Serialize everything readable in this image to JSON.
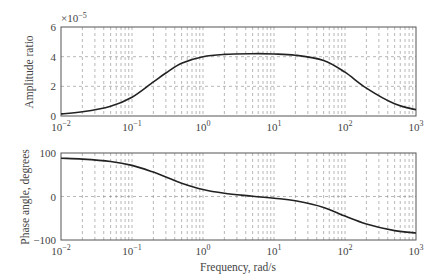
{
  "chart_data": [
    {
      "type": "line",
      "title": "",
      "xlabel": "",
      "ylabel": "Amplitude ratio",
      "xscale": "log",
      "xlim": [
        0.01,
        1000
      ],
      "ylim": [
        0,
        6e-05
      ],
      "y_multiplier_label": "×10",
      "y_multiplier_exp": "−5",
      "yticks": [
        0,
        2,
        4,
        6
      ],
      "ytick_labels": [
        "0",
        "2",
        "4",
        "6"
      ],
      "xticks": [
        0.01,
        0.1,
        1,
        10,
        100,
        1000
      ],
      "xtick_base": "10",
      "xtick_exps": [
        "−2",
        "−1",
        "0",
        "1",
        "2",
        "3"
      ],
      "grid": true,
      "series": [
        {
          "name": "Amplitude ratio",
          "x": [
            0.01,
            0.02,
            0.05,
            0.1,
            0.2,
            0.3,
            0.5,
            1,
            2,
            5,
            10,
            20,
            50,
            100,
            200,
            500,
            1000
          ],
          "values": [
            1.4e-06,
            2.8e-06,
            6.6e-06,
            1.27e-05,
            2.3e-05,
            2.9e-05,
            3.55e-05,
            4e-05,
            4.15e-05,
            4.2e-05,
            4.18e-05,
            4.1e-05,
            3.75e-05,
            2.95e-05,
            1.88e-05,
            8.2e-06,
            4.2e-06
          ]
        }
      ]
    },
    {
      "type": "line",
      "title": "",
      "xlabel": "Frequency, rad/s",
      "ylabel": "Phase angle, degrees",
      "xscale": "log",
      "xlim": [
        0.01,
        1000
      ],
      "ylim": [
        -100,
        100
      ],
      "yticks": [
        -100,
        0,
        100
      ],
      "ytick_labels": [
        "−100",
        "0",
        "100"
      ],
      "xticks": [
        0.01,
        0.1,
        1,
        10,
        100,
        1000
      ],
      "xtick_base": "10",
      "xtick_exps": [
        "−2",
        "−1",
        "0",
        "1",
        "2",
        "3"
      ],
      "grid": true,
      "series": [
        {
          "name": "Phase angle",
          "x": [
            0.01,
            0.02,
            0.05,
            0.1,
            0.2,
            0.3,
            0.5,
            1,
            2,
            5,
            10,
            20,
            50,
            100,
            200,
            500,
            1000
          ],
          "values": [
            88,
            86,
            80.5,
            71.5,
            56,
            45,
            30.5,
            16,
            7.5,
            0.5,
            -4,
            -10,
            -25,
            -45,
            -63,
            -78.5,
            -84
          ]
        }
      ]
    }
  ]
}
